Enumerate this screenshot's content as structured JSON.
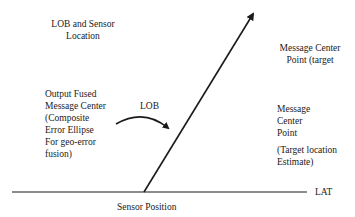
{
  "diagram": {
    "labels": {
      "lob_sensor_location": "LOB and Sensor\nLocation",
      "message_center_target": "Message Center\nPoint (target",
      "output_fused": "Output Fused\nMessage Center\n(Composite\nError Ellipse\nFor geo-error\nfusion)",
      "lob": "LOB",
      "message_center_point": "Message\nCenter\nPoint",
      "target_location_estimate": "(Target location\nEstimate)",
      "lat": "LAT",
      "sensor_position": "Sensor Position"
    },
    "colors": {
      "line": "#1a1a1a",
      "background": "#ffffff"
    }
  }
}
